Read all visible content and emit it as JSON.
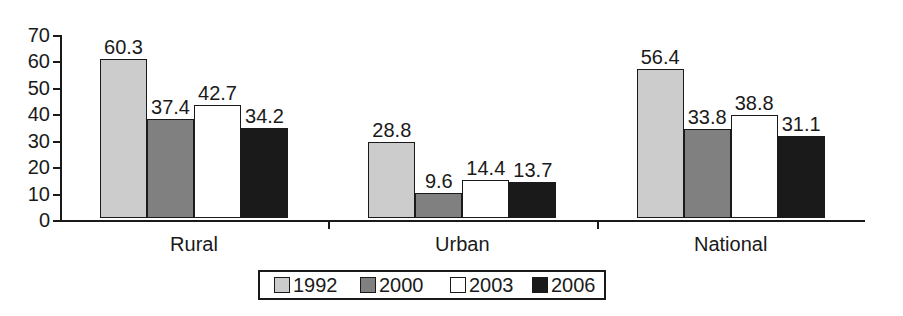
{
  "chart_data": {
    "type": "bar",
    "title": "",
    "subtitle": "",
    "xlabel": "",
    "ylabel": "",
    "ylim": [
      0,
      70
    ],
    "ytick_step": 10,
    "yticks": [
      0,
      10,
      20,
      30,
      40,
      50,
      60,
      70
    ],
    "ytick_labels": [
      "0",
      "10",
      "20",
      "30",
      "40",
      "50",
      "60",
      "70"
    ],
    "categories": [
      "Rural",
      "Urban",
      "National"
    ],
    "grid": false,
    "legend_position": "bottom-center",
    "data_labels": true,
    "series": [
      {
        "name": "1992",
        "color": "#cccccc",
        "values": [
          60.3,
          28.8,
          56.4
        ],
        "labels": [
          "60.3",
          "28.8",
          "56.4"
        ]
      },
      {
        "name": "2000",
        "color": "#808080",
        "values": [
          37.4,
          9.6,
          33.8
        ],
        "labels": [
          "37.4",
          "9.6",
          "33.8"
        ]
      },
      {
        "name": "2003",
        "color": "#ffffff",
        "values": [
          42.7,
          14.4,
          38.8
        ],
        "labels": [
          "42.7",
          "14.4",
          "38.8"
        ]
      },
      {
        "name": "2006",
        "color": "#1a1a1a",
        "values": [
          34.2,
          13.7,
          31.1
        ],
        "labels": [
          "34.2",
          "13.7",
          "31.1"
        ]
      }
    ],
    "axis_color": "#1a1a1a",
    "background": "#ffffff"
  },
  "legend": {
    "entries": [
      {
        "label": "1992",
        "swatch": "#cccccc"
      },
      {
        "label": "2000",
        "swatch": "#808080"
      },
      {
        "label": "2003",
        "swatch": "#ffffff"
      },
      {
        "label": "2006",
        "swatch": "#1a1a1a"
      }
    ]
  }
}
